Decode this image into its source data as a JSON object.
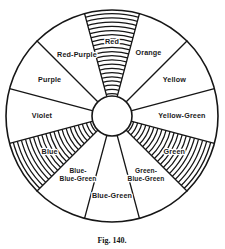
{
  "figure": {
    "caption": "Fig. 140.",
    "accent_color": "#161616",
    "background_color": "#ffffff",
    "center": {
      "x": 112,
      "y": 116
    },
    "outer_radius": 106,
    "hub_radius": 20,
    "sector_count": 12,
    "sectors": [
      {
        "name": "red",
        "label": "Red",
        "label_lines": [
          "Red"
        ],
        "start_angle": -15,
        "end_angle": 15,
        "hatched": true,
        "label_radius": 74
      },
      {
        "name": "orange",
        "label": "Orange",
        "label_lines": [
          "Orange"
        ],
        "start_angle": 15,
        "end_angle": 45,
        "hatched": false,
        "label_radius": 73
      },
      {
        "name": "yellow",
        "label": "Yellow",
        "label_lines": [
          "Yellow"
        ],
        "start_angle": 45,
        "end_angle": 75,
        "hatched": false,
        "label_radius": 72
      },
      {
        "name": "yellow-green",
        "label": "Yellow-Green",
        "label_lines": [
          "Yellow-Green"
        ],
        "start_angle": 75,
        "end_angle": 105,
        "hatched": false,
        "label_radius": 70
      },
      {
        "name": "green",
        "label": "Green",
        "label_lines": [
          "Green"
        ],
        "start_angle": 105,
        "end_angle": 135,
        "hatched": true,
        "label_radius": 72
      },
      {
        "name": "green-blue-green",
        "label": "Green-Blue-Green",
        "label_lines": [
          "Green-",
          "Blue-Green"
        ],
        "start_angle": 135,
        "end_angle": 165,
        "hatched": false,
        "label_radius": 68
      },
      {
        "name": "blue-green",
        "label": "Blue-Green",
        "label_lines": [
          "Blue-Green"
        ],
        "start_angle": 165,
        "end_angle": 195,
        "hatched": false,
        "label_radius": 80
      },
      {
        "name": "blue-blue-green",
        "label": "Blue-Blue-Green",
        "label_lines": [
          "Blue-",
          "Blue-Green"
        ],
        "start_angle": 195,
        "end_angle": 225,
        "hatched": false,
        "label_radius": 68
      },
      {
        "name": "blue",
        "label": "Blue",
        "label_lines": [
          "Blue"
        ],
        "start_angle": 225,
        "end_angle": 255,
        "hatched": true,
        "label_radius": 72
      },
      {
        "name": "violet",
        "label": "Violet",
        "label_lines": [
          "Violet"
        ],
        "start_angle": 255,
        "end_angle": 285,
        "hatched": false,
        "label_radius": 70
      },
      {
        "name": "purple",
        "label": "Purple",
        "label_lines": [
          "Purple"
        ],
        "start_angle": 285,
        "end_angle": 315,
        "hatched": false,
        "label_radius": 72
      },
      {
        "name": "red-purple",
        "label": "Red-Purple",
        "label_lines": [
          "Red-Purple"
        ],
        "start_angle": 315,
        "end_angle": 345,
        "hatched": false,
        "label_radius": 70
      }
    ]
  }
}
